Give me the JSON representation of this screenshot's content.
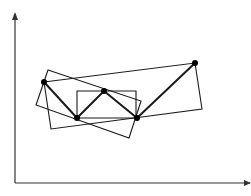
{
  "diagram": {
    "width": 251,
    "height": 196,
    "stroke_color": "#1a1a1a",
    "axis_color": "#333333",
    "background": "#ffffff",
    "axes": {
      "origin": [
        15,
        183
      ],
      "y_axis_end": [
        15,
        14
      ],
      "x_axis_end": [
        250,
        183
      ],
      "y_arrowhead": true,
      "x_arrowhead": true
    },
    "points": [
      {
        "id": "P1",
        "x": 44,
        "y": 82
      },
      {
        "id": "P2",
        "x": 77,
        "y": 118
      },
      {
        "id": "P3",
        "x": 104,
        "y": 91
      },
      {
        "id": "P4",
        "x": 137,
        "y": 118
      },
      {
        "id": "P5",
        "x": 195,
        "y": 63
      }
    ],
    "polyline": [
      "P1",
      "P2",
      "P3",
      "P4",
      "P5"
    ],
    "rectangles": [
      {
        "name": "axis-aligned-box",
        "corners": [
          [
            77,
            91
          ],
          [
            136,
            91
          ],
          [
            136,
            118
          ],
          [
            77,
            118
          ]
        ]
      },
      {
        "name": "large-tilted-box",
        "corners": [
          [
            44,
            82
          ],
          [
            195,
            63
          ],
          [
            202,
            109
          ],
          [
            51,
            129
          ]
        ]
      },
      {
        "name": "small-tilted-box",
        "corners": [
          [
            48,
            70
          ],
          [
            141,
            101
          ],
          [
            129,
            138
          ],
          [
            36,
            105
          ]
        ]
      }
    ]
  }
}
